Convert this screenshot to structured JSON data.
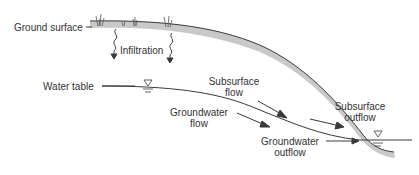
{
  "diagram": {
    "labels": {
      "ground_surface": "Ground surface",
      "infiltration": "Infiltration",
      "water_table": "Water table",
      "subsurface_flow_1": "Subsurface",
      "subsurface_flow_2": "flow",
      "groundwater_flow_1": "Groundwater",
      "groundwater_flow_2": "flow",
      "subsurface_outflow_1": "Subsurface",
      "subsurface_outflow_2": "outflow",
      "groundwater_outflow_1": "Groundwater",
      "groundwater_outflow_2": "outflow"
    },
    "colors": {
      "soil_band": "#c8c8c8",
      "line": "#3a3a3a",
      "text": "#333333"
    }
  }
}
